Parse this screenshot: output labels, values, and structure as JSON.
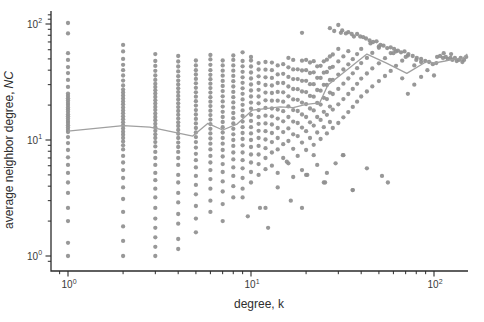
{
  "figure": {
    "background": "#ffffff"
  },
  "chart_data": {
    "type": "scatter",
    "title": "",
    "xlabel": "degree, k",
    "ylabel_main": "average neighbor degree,",
    "ylabel_italic": "NC",
    "xscale": "log",
    "yscale": "log",
    "xlim": [
      0.8,
      155
    ],
    "ylim": [
      0.74,
      135
    ],
    "grid": false,
    "legend": "none",
    "marker_color": "#8f8f8f",
    "line_color": "#a0a0a0",
    "axis_color": "#2b2b2b",
    "tick_base": "10",
    "xticks": [
      {
        "value": 1,
        "exp": "0"
      },
      {
        "value": 10,
        "exp": "1"
      },
      {
        "value": 100,
        "exp": "2"
      }
    ],
    "yticks": [
      {
        "value": 1,
        "exp": "0"
      },
      {
        "value": 10,
        "exp": "1"
      },
      {
        "value": 100,
        "exp": "2"
      }
    ],
    "x_minor_ticks": [
      0.9,
      2,
      3,
      4,
      5,
      6,
      7,
      8,
      9,
      20,
      30,
      40,
      50,
      60,
      70,
      80,
      90
    ],
    "y_minor_ticks": [
      0.9,
      2,
      3,
      4,
      5,
      6,
      7,
      8,
      9,
      20,
      30,
      40,
      50,
      60,
      70,
      80,
      90,
      110,
      120
    ],
    "columns": [
      {
        "k": 1,
        "values": [
          1,
          1.3,
          2.0,
          2.6,
          3.5,
          4.3,
          5.2,
          6.1,
          7.1,
          8.2,
          9.4,
          10.6,
          11.7,
          12.2,
          12.8,
          13.4,
          14.0,
          14.6,
          15.3,
          16.0,
          16.7,
          17.5,
          18.3,
          19.1,
          20.0,
          20.9,
          21.9,
          22.9,
          24.0,
          25.1,
          28.7,
          33,
          37.7,
          42.5,
          49,
          56,
          83,
          102
        ]
      },
      {
        "k": 2,
        "values": [
          1,
          1.35,
          1.8,
          2.4,
          3.1,
          3.9,
          4.7,
          5.5,
          6.4,
          7.3,
          8.3,
          9.0,
          9.7,
          10.4,
          11.1,
          11.8,
          12.6,
          13.4,
          14.2,
          15.1,
          16.0,
          17.0,
          18.0,
          19.1,
          20.3,
          21.5,
          22.8,
          24.2,
          25.7,
          27.2,
          29.5,
          32.5,
          36,
          40,
          44.5,
          50,
          58,
          66
        ]
      },
      {
        "k": 3,
        "values": [
          1,
          1.2,
          1.45,
          1.75,
          2.1,
          2.6,
          3.2,
          3.8,
          4.5,
          5.2,
          6.1,
          7.0,
          7.9,
          8.8,
          9.6,
          10.4,
          11.2,
          12.0,
          12.9,
          13.8,
          14.8,
          15.8,
          16.9,
          18.1,
          19.3,
          20.6,
          22.0,
          23.5,
          25.1,
          26.8,
          28.6,
          30.5,
          33,
          36,
          39.5,
          43.5,
          48,
          55
        ]
      },
      {
        "k": 4,
        "values": [
          1.15,
          1.4,
          1.9,
          2.3,
          2.9,
          3.5,
          4.3,
          5.0,
          6.1,
          7.0,
          7.9,
          8.7,
          9.5,
          10.4,
          11.3,
          12.2,
          13.2,
          14.2,
          15.3,
          16.5,
          17.8,
          19.2,
          20.7,
          22.3,
          24.0,
          25.9,
          27.9,
          30.1,
          32.5,
          35.5,
          39,
          43,
          47.5,
          53
        ]
      },
      {
        "k": 5,
        "values": [
          1.6,
          2.1,
          2.7,
          3.4,
          4.1,
          4.9,
          5.8,
          6.7,
          7.6,
          8.6,
          9.6,
          10.6,
          11.6,
          12.7,
          13.9,
          15.2,
          16.6,
          18.1,
          19.8,
          21.6,
          23.6,
          25.8,
          28.2,
          30.8,
          33.6,
          36.7,
          40,
          44,
          48.5
        ]
      },
      {
        "k": 6,
        "values": [
          2.4,
          3.0,
          3.8,
          4.6,
          5.5,
          6.4,
          7.3,
          8.3,
          9.3,
          10.3,
          11.4,
          12.5,
          13.7,
          15.0,
          16.4,
          17.9,
          19.6,
          21.4,
          23.4,
          25.6,
          28.0,
          30.6,
          33.4,
          36.5,
          40,
          44.5,
          49.5,
          54
        ]
      },
      {
        "k": 7,
        "values": [
          2.0,
          2.8,
          3.6,
          4.4,
          5.3,
          6.2,
          7.2,
          8.2,
          9.3,
          10.4,
          11.6,
          12.9,
          14.3,
          15.8,
          17.5,
          19.4,
          21.5,
          23.8,
          26.4,
          29.2,
          32.3,
          35.8,
          39.6,
          44,
          48.5
        ]
      },
      {
        "k": 8,
        "values": [
          3.2,
          4.0,
          4.9,
          5.8,
          6.8,
          7.8,
          8.9,
          10.0,
          11.2,
          12.5,
          13.9,
          15.4,
          17.1,
          19.0,
          21.1,
          23.4,
          26.0,
          28.9,
          32.1,
          35.7,
          39.6,
          44,
          49,
          53.5
        ]
      },
      {
        "k": 9,
        "values": [
          3.8,
          4.7,
          5.7,
          6.7,
          7.8,
          9.0,
          10.2,
          11.5,
          12.9,
          14.4,
          16.1,
          18.0,
          20.1,
          22.4,
          25.0,
          27.9,
          31.1,
          34.7,
          38.7,
          43.2,
          48,
          57
        ]
      },
      {
        "k": 10,
        "values": [
          4.3,
          5.3,
          6.4,
          7.5,
          8.7,
          10.0,
          11.4,
          12.9,
          14.6,
          16.5,
          18.6,
          21.0,
          23.7,
          26.7,
          30.1,
          33.9,
          38.2,
          43,
          48.5,
          52
        ]
      },
      {
        "k": 11,
        "values": [
          5.0,
          6.2,
          7.5,
          8.9,
          10.4,
          12.0,
          13.8,
          15.8,
          18.1,
          20.7,
          23.7,
          27.1,
          31.0,
          35.4,
          40.5,
          46
        ]
      },
      {
        "k": 12,
        "values": [
          2.6,
          5.6,
          7.0,
          8.5,
          10.1,
          11.9,
          13.9,
          16.2,
          18.9,
          22.0,
          25.6,
          29.8,
          34.7,
          40.4,
          47
        ]
      }
    ],
    "cloud_points": [
      [
        13,
        6
      ],
      [
        13,
        7.8
      ],
      [
        13,
        9.6
      ],
      [
        13,
        11.5
      ],
      [
        13,
        13.6
      ],
      [
        13,
        16
      ],
      [
        13,
        18.7
      ],
      [
        13,
        21.8
      ],
      [
        13,
        25.4
      ],
      [
        13,
        29.5
      ],
      [
        13,
        34.3
      ],
      [
        13,
        40
      ],
      [
        13,
        46.5
      ],
      [
        14,
        5.2
      ],
      [
        14,
        8.3
      ],
      [
        14,
        10.4
      ],
      [
        14,
        12.7
      ],
      [
        14,
        15.3
      ],
      [
        14,
        18.3
      ],
      [
        14,
        21.8
      ],
      [
        14,
        26
      ],
      [
        14,
        31
      ],
      [
        14,
        36.8
      ],
      [
        14,
        44
      ],
      [
        15,
        7
      ],
      [
        15,
        9.2
      ],
      [
        15,
        11.7
      ],
      [
        15,
        14.5
      ],
      [
        15,
        17.7
      ],
      [
        15,
        21.4
      ],
      [
        15,
        25.8
      ],
      [
        15,
        31
      ],
      [
        15,
        37.2
      ],
      [
        15,
        45
      ],
      [
        16,
        6.3
      ],
      [
        16,
        9.8
      ],
      [
        16,
        12.6
      ],
      [
        16,
        15.8
      ],
      [
        16,
        19.5
      ],
      [
        16,
        23.8
      ],
      [
        16,
        28.9
      ],
      [
        16,
        35
      ],
      [
        16,
        42.3
      ],
      [
        16,
        51
      ],
      [
        17,
        4.8
      ],
      [
        17,
        8.4
      ],
      [
        17,
        11.2
      ],
      [
        17,
        14.4
      ],
      [
        17,
        18.1
      ],
      [
        17,
        22.4
      ],
      [
        17,
        27.5
      ],
      [
        17,
        33.5
      ],
      [
        17,
        40.6
      ],
      [
        17,
        49
      ],
      [
        18,
        7.3
      ],
      [
        18,
        10.8
      ],
      [
        18,
        14
      ],
      [
        18,
        17.8
      ],
      [
        18,
        22.2
      ],
      [
        18,
        27.4
      ],
      [
        18,
        33.5
      ],
      [
        18,
        40.7
      ],
      [
        19,
        5.5
      ],
      [
        19,
        9.5
      ],
      [
        19,
        12.8
      ],
      [
        19,
        16.6
      ],
      [
        19,
        21
      ],
      [
        19,
        26.2
      ],
      [
        19,
        32.4
      ],
      [
        19,
        39.7
      ],
      [
        19,
        48.3
      ],
      [
        20,
        5
      ],
      [
        20,
        8.2
      ],
      [
        20,
        11.9
      ],
      [
        20,
        15.8
      ],
      [
        20,
        20.4
      ],
      [
        20,
        25.9
      ],
      [
        20,
        32.4
      ],
      [
        20,
        40
      ],
      [
        20,
        49
      ],
      [
        21,
        10.4
      ],
      [
        21,
        14.2
      ],
      [
        21,
        18.7
      ],
      [
        21,
        24
      ],
      [
        21,
        30.3
      ],
      [
        21,
        37.8
      ],
      [
        21,
        46.6
      ],
      [
        22,
        7.4
      ],
      [
        22,
        9.1
      ],
      [
        22,
        13.3
      ],
      [
        22,
        18
      ],
      [
        22,
        23.6
      ],
      [
        22,
        30.3
      ],
      [
        22,
        38.3
      ],
      [
        22,
        47.8
      ],
      [
        23,
        6.1
      ],
      [
        23,
        11.6
      ],
      [
        23,
        15.8
      ],
      [
        23,
        20.9
      ],
      [
        23,
        27
      ],
      [
        23,
        34.4
      ],
      [
        23,
        43.2
      ],
      [
        24,
        10.2
      ],
      [
        24,
        14.9
      ],
      [
        24,
        20.2
      ],
      [
        24,
        26.6
      ],
      [
        24,
        34.3
      ],
      [
        24,
        43.6
      ],
      [
        25,
        4.3
      ],
      [
        25,
        12.9
      ],
      [
        25,
        17.5
      ],
      [
        25,
        23.1
      ],
      [
        25,
        29.9
      ],
      [
        25,
        38
      ],
      [
        25,
        47.7
      ],
      [
        26,
        5.2
      ],
      [
        26,
        11.4
      ],
      [
        26,
        16.5
      ],
      [
        26,
        22.5
      ],
      [
        26,
        29.8
      ],
      [
        26,
        38.6
      ],
      [
        26,
        49.2
      ],
      [
        27,
        14.3
      ],
      [
        27,
        19.4
      ],
      [
        27,
        25.6
      ],
      [
        27,
        33
      ],
      [
        27,
        41.9
      ],
      [
        27,
        52.5
      ],
      [
        28,
        12.7
      ],
      [
        28,
        18.3
      ],
      [
        28,
        24.9
      ],
      [
        28,
        33
      ],
      [
        28,
        42.8
      ],
      [
        28,
        54.6
      ],
      [
        30,
        14
      ],
      [
        30,
        20.3
      ],
      [
        30,
        27.6
      ],
      [
        30,
        36.6
      ],
      [
        30,
        47.6
      ],
      [
        30,
        61
      ],
      [
        32,
        7.4
      ],
      [
        32,
        15.7
      ],
      [
        32,
        22.5
      ],
      [
        32,
        30.6
      ],
      [
        32,
        40.5
      ],
      [
        32,
        52.6
      ],
      [
        34,
        17.4
      ],
      [
        34,
        24.9
      ],
      [
        34,
        33.9
      ],
      [
        34,
        44.9
      ],
      [
        34,
        58.3
      ],
      [
        36,
        3.7
      ],
      [
        36,
        19.3
      ],
      [
        36,
        27.6
      ],
      [
        36,
        37.6
      ],
      [
        36,
        49.7
      ],
      [
        38,
        21.4
      ],
      [
        38,
        30.5
      ],
      [
        38,
        41.6
      ],
      [
        38,
        55
      ],
      [
        40,
        23.7
      ],
      [
        40,
        33.8
      ],
      [
        40,
        46
      ],
      [
        40,
        61
      ],
      [
        43,
        5.7
      ],
      [
        43,
        26.2
      ],
      [
        43,
        37.4
      ],
      [
        43,
        51
      ],
      [
        46,
        29
      ],
      [
        46,
        41.4
      ],
      [
        46,
        56.4
      ],
      [
        50,
        32.2
      ],
      [
        50,
        45.8
      ],
      [
        50,
        62.4
      ],
      [
        52,
        4.9
      ],
      [
        54,
        35.6
      ],
      [
        54,
        50.7
      ],
      [
        56,
        4.3
      ],
      [
        58,
        39.4
      ],
      [
        58,
        56.1
      ],
      [
        62,
        43.6
      ],
      [
        62,
        58
      ],
      [
        67,
        34
      ],
      [
        67,
        48.3
      ],
      [
        72,
        25
      ],
      [
        72,
        53.4
      ],
      [
        78,
        30
      ],
      [
        78,
        44
      ],
      [
        85,
        35
      ],
      [
        85,
        47
      ],
      [
        92,
        40
      ],
      [
        100,
        36
      ]
    ],
    "band_points": [
      [
        19,
        84
      ],
      [
        27,
        92
      ],
      [
        28.5,
        87
      ],
      [
        30,
        98
      ],
      [
        31,
        84
      ],
      [
        31.5,
        88
      ],
      [
        33,
        83
      ],
      [
        34,
        85
      ],
      [
        35.5,
        82
      ],
      [
        36.5,
        78
      ],
      [
        38,
        82
      ],
      [
        39.5,
        78
      ],
      [
        41,
        77
      ],
      [
        42.5,
        75
      ],
      [
        44.5,
        72
      ],
      [
        45,
        68
      ],
      [
        46.5,
        70
      ],
      [
        48.5,
        71
      ],
      [
        50,
        64
      ],
      [
        51,
        66
      ],
      [
        53,
        65
      ],
      [
        55.5,
        62
      ],
      [
        58,
        63
      ],
      [
        60,
        56
      ],
      [
        60.5,
        61
      ],
      [
        63.5,
        59
      ],
      [
        66,
        57
      ],
      [
        69,
        58
      ],
      [
        70,
        52
      ],
      [
        72.5,
        55
      ],
      [
        76.5,
        53
      ],
      [
        80,
        49
      ],
      [
        80.5,
        51
      ],
      [
        85,
        50
      ],
      [
        89.5,
        48
      ],
      [
        94,
        47
      ],
      [
        98.5,
        45
      ],
      [
        103,
        46
      ]
    ],
    "cluster_points": [
      [
        104,
        52
      ],
      [
        108,
        53
      ],
      [
        112,
        51
      ],
      [
        113,
        56
      ],
      [
        116,
        52
      ],
      [
        119,
        50
      ],
      [
        123,
        51
      ],
      [
        124,
        55
      ],
      [
        126,
        49
      ],
      [
        130,
        51
      ],
      [
        133,
        48
      ],
      [
        137,
        49
      ],
      [
        140,
        51
      ],
      [
        143,
        47
      ],
      [
        146,
        49
      ],
      [
        150,
        52
      ]
    ],
    "low_points": [
      [
        9,
        3.2
      ],
      [
        9.6,
        2.2
      ],
      [
        11.2,
        2.6
      ],
      [
        12.4,
        1.75
      ],
      [
        14,
        3.9
      ],
      [
        15.7,
        6.5
      ],
      [
        16.5,
        3.0
      ],
      [
        19,
        2.6
      ],
      [
        20.3,
        5
      ],
      [
        25.4,
        4.3
      ],
      [
        29,
        6.3
      ],
      [
        31.8,
        7.4
      ],
      [
        35.9,
        3.7
      ]
    ],
    "trend_line": [
      [
        1,
        11.9
      ],
      [
        2,
        13.3
      ],
      [
        2.8,
        12.9
      ],
      [
        4.8,
        10.8
      ],
      [
        5.8,
        13.9
      ],
      [
        7,
        12.2
      ],
      [
        8.4,
        13.7
      ],
      [
        10.2,
        18.1
      ],
      [
        12,
        18.6
      ],
      [
        14.4,
        19.3
      ],
      [
        17,
        19
      ],
      [
        20,
        20.3
      ],
      [
        23.7,
        20.9
      ],
      [
        26.3,
        29.8
      ],
      [
        32,
        38
      ],
      [
        43,
        55
      ],
      [
        55,
        46
      ],
      [
        71,
        37.5
      ],
      [
        92,
        48
      ],
      [
        100,
        46
      ],
      [
        115,
        48
      ],
      [
        130,
        50
      ],
      [
        142,
        50
      ],
      [
        152,
        55
      ]
    ]
  }
}
